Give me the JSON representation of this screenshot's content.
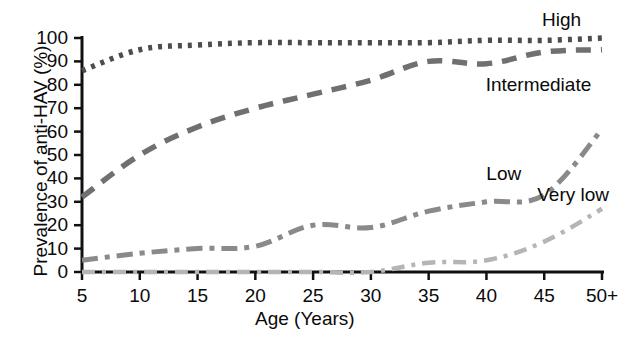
{
  "chart_data": {
    "type": "line",
    "title": "",
    "xlabel": "Age (Years)",
    "ylabel": "Prevalence of anti-HAV (%)",
    "xlim": [
      5,
      50
    ],
    "ylim": [
      0,
      100
    ],
    "grid": false,
    "legend_position": "inline-annotations",
    "x_tick_labels": [
      "5",
      "10",
      "15",
      "20",
      "25",
      "30",
      "35",
      "40",
      "45",
      "50+"
    ],
    "x_tick_values": [
      5,
      10,
      15,
      20,
      25,
      30,
      35,
      40,
      45,
      50
    ],
    "y_tick_labels": [
      "0",
      "10",
      "20",
      "30",
      "40",
      "50",
      "60",
      "70",
      "80",
      "90",
      "100"
    ],
    "y_tick_values": [
      0,
      10,
      20,
      30,
      40,
      50,
      60,
      70,
      80,
      90,
      100
    ],
    "x": [
      5,
      10,
      15,
      20,
      25,
      30,
      35,
      40,
      45,
      50
    ],
    "series": [
      {
        "name": "High",
        "label": "High",
        "color": "#4d4d4d",
        "dash": "dotted",
        "values": [
          86,
          95,
          97,
          98,
          98,
          98,
          98,
          99,
          99,
          100
        ]
      },
      {
        "name": "Intermediate",
        "label": "Intermediate",
        "color": "#707070",
        "dash": "long-dash",
        "values": [
          32,
          50,
          62,
          70,
          76,
          82,
          90,
          89,
          94,
          95
        ]
      },
      {
        "name": "Low",
        "label": "Low",
        "color": "#8a8a8a",
        "dash": "dash-dot",
        "values": [
          5,
          8,
          10,
          11,
          20,
          19,
          26,
          30,
          33,
          61
        ]
      },
      {
        "name": "Very low",
        "label": "Very low",
        "color": "#b5b5b5",
        "dash": "dash-dot-fine",
        "values": [
          0,
          0,
          0,
          0,
          0,
          0,
          4,
          5,
          13,
          27
        ]
      }
    ],
    "annotations": [
      {
        "text": "High",
        "x": 46.5,
        "y": 107
      },
      {
        "text": "Intermediate",
        "x": 44.5,
        "y": 79
      },
      {
        "text": "Low",
        "x": 41.5,
        "y": 41
      },
      {
        "text": "Very low",
        "x": 47.5,
        "y": 32
      }
    ]
  },
  "axes": {
    "y_title": "Prevalence of anti-HAV (%)",
    "x_title": "Age (Years)"
  }
}
